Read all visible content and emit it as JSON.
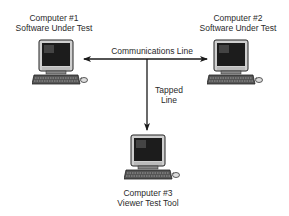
{
  "diagram": {
    "nodes": [
      {
        "id": "computer-1",
        "title": "Computer #1",
        "subtitle": "Software Under Test"
      },
      {
        "id": "computer-2",
        "title": "Computer #2",
        "subtitle": "Software Under Test"
      },
      {
        "id": "computer-3",
        "title": "Computer #3",
        "subtitle": "Viewer Test Tool"
      }
    ],
    "edges": [
      {
        "from": "computer-1",
        "to": "computer-2",
        "label": "Communications Line",
        "style": "double-arrow"
      },
      {
        "from": "communications-line",
        "to": "computer-3",
        "label_line1": "Tapped",
        "label_line2": "Line",
        "style": "arrow"
      }
    ],
    "colors": {
      "line": "#1a1a1a",
      "background": "#ffffff"
    }
  }
}
